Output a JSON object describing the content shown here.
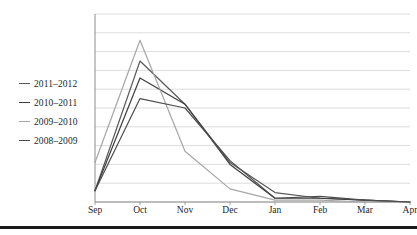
{
  "figure": {
    "background_color": "#ffffff",
    "bottom_rule_color": "#1a1a1a"
  },
  "legend": {
    "position": "left-inside",
    "entries": [
      {
        "label": "2011–2012",
        "color": "#595959"
      },
      {
        "label": "2010–2011",
        "color": "#3d3d3d"
      },
      {
        "label": "2009–2010",
        "color": "#a6a6a6"
      },
      {
        "label": "2008–2009",
        "color": "#4d4d4d"
      }
    ]
  },
  "axes": {
    "plot_left": 95,
    "plot_right": 410,
    "plot_top": 14,
    "plot_bottom": 202,
    "gridline_color": "#d9d9d9",
    "axis_color": "#8c8c8c",
    "grid_count": 10,
    "y_tick_labels": []
  },
  "chart_data": {
    "type": "line",
    "title": "",
    "xlabel": "",
    "ylabel": "",
    "categories": [
      "Sep",
      "Oct",
      "Nov",
      "Dec",
      "Jan",
      "Feb",
      "Mar",
      "Apr"
    ],
    "ylim": [
      0,
      100
    ],
    "xlim_categories": 8,
    "grid": true,
    "legend_position": "left",
    "series": [
      {
        "name": "2011–2012",
        "color": "#595959",
        "values": [
          6,
          75,
          52,
          21,
          5,
          2,
          1,
          0
        ]
      },
      {
        "name": "2010–2011",
        "color": "#3d3d3d",
        "values": [
          6,
          66,
          52,
          20,
          2,
          2,
          1,
          0
        ]
      },
      {
        "name": "2009–2010",
        "color": "#a6a6a6",
        "values": [
          21,
          86,
          27,
          7,
          1,
          1,
          0,
          0
        ]
      },
      {
        "name": "2008–2009",
        "color": "#4d4d4d",
        "values": [
          6,
          55,
          50,
          22,
          2,
          3,
          1,
          0
        ]
      }
    ]
  },
  "x_tick_labels": [
    "Sep",
    "Oct",
    "Nov",
    "Dec",
    "Jan",
    "Feb",
    "Mar",
    "Apr"
  ]
}
